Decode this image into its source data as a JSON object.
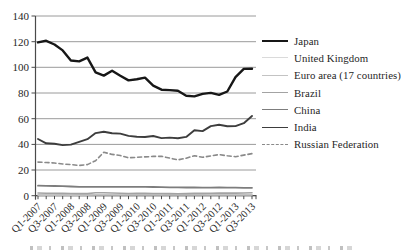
{
  "figure": {
    "background": "#ffffff",
    "caption_note": "caption-tops-clipped-at-bottom-edge"
  },
  "chart_data": {
    "type": "line",
    "title": "",
    "xlabel": "",
    "ylabel": "",
    "ylim": [
      0,
      140
    ],
    "y_ticks": [
      0,
      20,
      40,
      60,
      80,
      100,
      120,
      140
    ],
    "grid": "horizontal",
    "legend_position": "right",
    "colors": {
      "grid": "#8f8f8f",
      "axis": "#4a4a4a",
      "text": "#262626"
    },
    "x_categories": [
      "Q1-2007",
      "Q2-2007",
      "Q3-2007",
      "Q4-2007",
      "Q1-2008",
      "Q2-2008",
      "Q3-2008",
      "Q4-2008",
      "Q1-2009",
      "Q2-2009",
      "Q3-2009",
      "Q4-2009",
      "Q1-2010",
      "Q2-2010",
      "Q3-2010",
      "Q4-2010",
      "Q1-2011",
      "Q2-2011",
      "Q3-2011",
      "Q4-2011",
      "Q1-2012",
      "Q2-2012",
      "Q3-2012",
      "Q4-2012",
      "Q1-2013",
      "Q2-2013",
      "Q3-2013"
    ],
    "x_tick_labels": [
      "Q1-2007",
      "Q3-2007",
      "Q1-2008",
      "Q3-2008",
      "Q1-2009",
      "Q3-2009",
      "Q1-2010",
      "Q3-2010",
      "Q1-2011",
      "Q3-2011",
      "Q1-2012",
      "Q3-2012",
      "Q1-2013",
      "Q3-2013"
    ],
    "draw_order": [
      1,
      2,
      3,
      4,
      6,
      5,
      0
    ],
    "series": [
      {
        "id": "japan",
        "name": "Japan",
        "color": "#171717",
        "width": 2.4,
        "values": [
          119.4,
          120.7,
          117.8,
          113.2,
          105.3,
          104.6,
          107.6,
          96.1,
          93.6,
          97.4,
          93.5,
          89.8,
          90.7,
          92.0,
          85.8,
          82.6,
          82.3,
          81.7,
          77.8,
          77.4,
          79.3,
          80.1,
          78.6,
          81.2,
          92.3,
          98.8,
          98.9
        ]
      },
      {
        "id": "united-kingdom",
        "name": "United Kingdom",
        "color": "#dadada",
        "width": 1.3,
        "values": [
          0.51,
          0.5,
          0.49,
          0.49,
          0.5,
          0.51,
          0.53,
          0.64,
          0.7,
          0.65,
          0.61,
          0.61,
          0.64,
          0.67,
          0.64,
          0.63,
          0.62,
          0.61,
          0.62,
          0.64,
          0.64,
          0.63,
          0.63,
          0.62,
          0.65,
          0.65,
          0.64
        ]
      },
      {
        "id": "euro-area",
        "name": "Euro area (17 countries)",
        "color": "#c3c3c3",
        "width": 1.6,
        "values": [
          0.76,
          0.74,
          0.73,
          0.69,
          0.66,
          0.64,
          0.67,
          0.75,
          0.76,
          0.73,
          0.7,
          0.68,
          0.72,
          0.79,
          0.77,
          0.74,
          0.73,
          0.69,
          0.71,
          0.74,
          0.76,
          0.78,
          0.8,
          0.77,
          0.76,
          0.77,
          0.75
        ]
      },
      {
        "id": "brazil",
        "name": "Brazil",
        "color": "#a3a3a3",
        "width": 1.6,
        "values": [
          2.11,
          1.98,
          1.92,
          1.79,
          1.74,
          1.66,
          1.67,
          2.28,
          2.31,
          2.07,
          1.87,
          1.74,
          1.8,
          1.79,
          1.75,
          1.7,
          1.67,
          1.59,
          1.64,
          1.8,
          1.77,
          1.96,
          2.03,
          2.06,
          2.0,
          2.07,
          2.29
        ]
      },
      {
        "id": "china",
        "name": "China",
        "color": "#7d7d7d",
        "width": 1.8,
        "values": [
          7.76,
          7.68,
          7.56,
          7.42,
          7.16,
          6.96,
          6.84,
          6.84,
          6.84,
          6.83,
          6.83,
          6.83,
          6.83,
          6.82,
          6.77,
          6.65,
          6.58,
          6.5,
          6.42,
          6.36,
          6.31,
          6.33,
          6.35,
          6.25,
          6.22,
          6.16,
          6.13
        ]
      },
      {
        "id": "india",
        "name": "India",
        "color": "#3d3d3d",
        "width": 1.9,
        "values": [
          44.2,
          40.8,
          40.4,
          39.4,
          39.8,
          42.0,
          44.0,
          48.8,
          49.8,
          48.7,
          48.4,
          46.6,
          45.9,
          45.7,
          46.5,
          44.9,
          45.3,
          44.7,
          45.8,
          51.0,
          50.3,
          54.2,
          55.2,
          54.1,
          54.2,
          56.5,
          62.1
        ]
      },
      {
        "id": "russian-federation",
        "name": "Russian Federation",
        "color": "#8a8a8a",
        "width": 1.6,
        "dash": "4 3",
        "values": [
          26.2,
          25.9,
          25.5,
          24.7,
          24.2,
          23.6,
          24.2,
          27.3,
          33.9,
          32.2,
          31.3,
          29.5,
          29.9,
          30.2,
          30.6,
          30.7,
          29.3,
          27.9,
          29.2,
          31.2,
          29.9,
          31.0,
          32.0,
          31.1,
          30.4,
          31.6,
          32.8
        ]
      }
    ]
  }
}
